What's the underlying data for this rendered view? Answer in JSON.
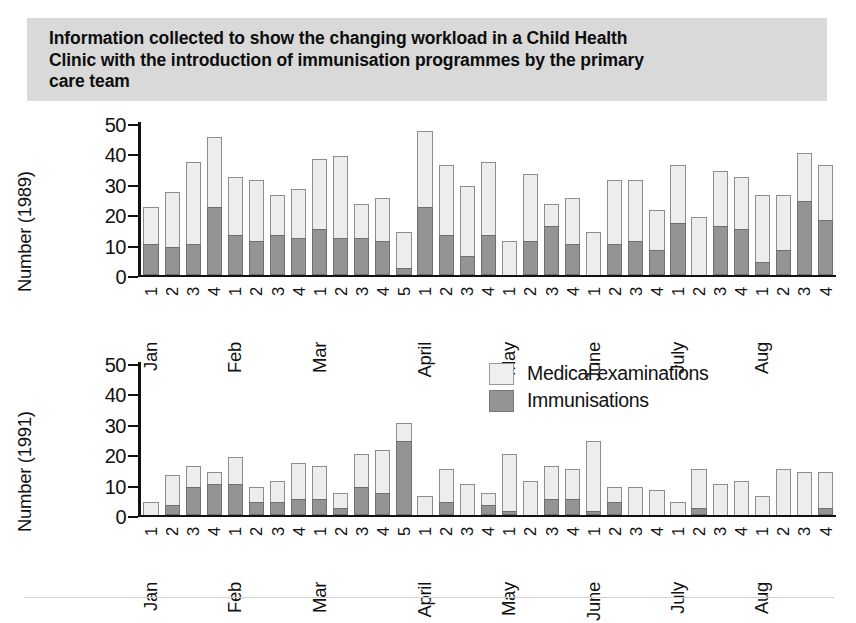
{
  "title": {
    "lines": [
      "Information collected to show the changing workload in a Child Health",
      "Clinic with the introduction of immunisation programmes by the primary",
      "care team"
    ],
    "band_color": "#d9d9d9"
  },
  "legend": {
    "items": [
      {
        "label": "Medical examinations",
        "color": "#efefef",
        "key": "exam"
      },
      {
        "label": "Immunisations",
        "color": "#949494",
        "key": "imm"
      }
    ]
  },
  "colors": {
    "medical_examinations": "#ededed",
    "immunisations": "#949494",
    "axis": "#111111",
    "title_band": "#d9d9d9"
  },
  "chart_data": [
    {
      "type": "bar",
      "stacked": true,
      "title": "",
      "ylabel": "Number (1989)",
      "xlabel": "",
      "ylim": [
        0,
        50
      ],
      "yticks": [
        0,
        10,
        20,
        30,
        40,
        50
      ],
      "grid": false,
      "legend_position": "none",
      "categories": [
        "Jan 1",
        "Jan 2",
        "Jan 3",
        "Jan 4",
        "Feb 1",
        "Feb 2",
        "Feb 3",
        "Feb 4",
        "Mar 1",
        "Mar 2",
        "Mar 3",
        "Mar 4",
        "Mar 5",
        "April 1",
        "April 2",
        "April 3",
        "April 4",
        "May 1",
        "May 2",
        "May 3",
        "May 4",
        "June 1",
        "June 2",
        "June 3",
        "June 4",
        "July 1",
        "July 2",
        "July 3",
        "July 4",
        "Aug 1",
        "Aug 2",
        "Aug 3",
        "Aug 4"
      ],
      "week_numbers": [
        1,
        2,
        3,
        4,
        1,
        2,
        3,
        4,
        1,
        2,
        3,
        4,
        5,
        1,
        2,
        3,
        4,
        1,
        2,
        3,
        4,
        1,
        2,
        3,
        4,
        1,
        2,
        3,
        4,
        1,
        2,
        3,
        4
      ],
      "months": [
        {
          "name": "Jan",
          "weeks": 4
        },
        {
          "name": "Feb",
          "weeks": 4
        },
        {
          "name": "Mar",
          "weeks": 5
        },
        {
          "name": "April",
          "weeks": 4
        },
        {
          "name": "May",
          "weeks": 4
        },
        {
          "name": "June",
          "weeks": 4
        },
        {
          "name": "July",
          "weeks": 4
        },
        {
          "name": "Aug",
          "weeks": 4
        }
      ],
      "series": [
        {
          "name": "Immunisations",
          "values": [
            10,
            9,
            10,
            22,
            13,
            11,
            13,
            12,
            15,
            12,
            12,
            11,
            2,
            22,
            13,
            6,
            13,
            0,
            11,
            16,
            10,
            0,
            10,
            11,
            8,
            17,
            0,
            16,
            15,
            4,
            8,
            24,
            18
          ]
        },
        {
          "name": "Medical examinations",
          "values": [
            12,
            18,
            27,
            23,
            19,
            20,
            13,
            16,
            23,
            27,
            11,
            14,
            12,
            25,
            23,
            23,
            24,
            11,
            22,
            7,
            15,
            14,
            21,
            20,
            13,
            19,
            19,
            18,
            17,
            22,
            18,
            16,
            18
          ]
        }
      ],
      "totals": [
        22,
        27,
        37,
        45,
        32,
        31,
        26,
        28,
        38,
        39,
        23,
        25,
        14,
        47,
        36,
        29,
        37,
        11,
        33,
        23,
        25,
        14,
        31,
        31,
        21,
        36,
        19,
        34,
        32,
        26,
        26,
        40,
        36
      ]
    },
    {
      "type": "bar",
      "stacked": true,
      "title": "",
      "ylabel": "Number (1991)",
      "xlabel": "",
      "ylim": [
        0,
        50
      ],
      "yticks": [
        0,
        10,
        20,
        30,
        40,
        50
      ],
      "grid": false,
      "legend_position": "top-right",
      "categories": [
        "Jan 1",
        "Jan 2",
        "Jan 3",
        "Jan 4",
        "Feb 1",
        "Feb 2",
        "Feb 3",
        "Feb 4",
        "Mar 1",
        "Mar 2",
        "Mar 3",
        "Mar 4",
        "Mar 5",
        "April 1",
        "April 2",
        "April 3",
        "April 4",
        "May 1",
        "May 2",
        "May 3",
        "May 4",
        "June 1",
        "June 2",
        "June 3",
        "June 4",
        "July 1",
        "July 2",
        "July 3",
        "July 4",
        "Aug 1",
        "Aug 2",
        "Aug 3",
        "Aug 4"
      ],
      "week_numbers": [
        1,
        2,
        3,
        4,
        1,
        2,
        3,
        4,
        1,
        2,
        3,
        4,
        5,
        1,
        2,
        3,
        4,
        1,
        2,
        3,
        4,
        1,
        2,
        3,
        4,
        1,
        2,
        3,
        4,
        1,
        2,
        3,
        4
      ],
      "months": [
        {
          "name": "Jan",
          "weeks": 4
        },
        {
          "name": "Feb",
          "weeks": 4
        },
        {
          "name": "Mar",
          "weeks": 5
        },
        {
          "name": "April",
          "weeks": 4
        },
        {
          "name": "May",
          "weeks": 4
        },
        {
          "name": "June",
          "weeks": 4
        },
        {
          "name": "July",
          "weeks": 4
        },
        {
          "name": "Aug",
          "weeks": 4
        }
      ],
      "series": [
        {
          "name": "Immunisations",
          "values": [
            0,
            3,
            9,
            10,
            10,
            4,
            4,
            5,
            5,
            2,
            9,
            7,
            24,
            0,
            4,
            0,
            3,
            1,
            0,
            5,
            5,
            1,
            4,
            0,
            0,
            0,
            2,
            0,
            0,
            0,
            0,
            0,
            2
          ]
        },
        {
          "name": "Medical examinations",
          "values": [
            4,
            10,
            7,
            4,
            9,
            5,
            7,
            12,
            11,
            5,
            11,
            14,
            6,
            6,
            11,
            10,
            4,
            19,
            11,
            11,
            10,
            23,
            5,
            9,
            8,
            4,
            13,
            10,
            11,
            6,
            15,
            14,
            12
          ]
        }
      ],
      "totals": [
        4,
        13,
        16,
        14,
        19,
        9,
        11,
        17,
        16,
        7,
        20,
        21,
        30,
        6,
        15,
        10,
        7,
        20,
        11,
        16,
        15,
        24,
        9,
        9,
        8,
        4,
        15,
        10,
        11,
        6,
        15,
        14,
        14
      ]
    }
  ]
}
